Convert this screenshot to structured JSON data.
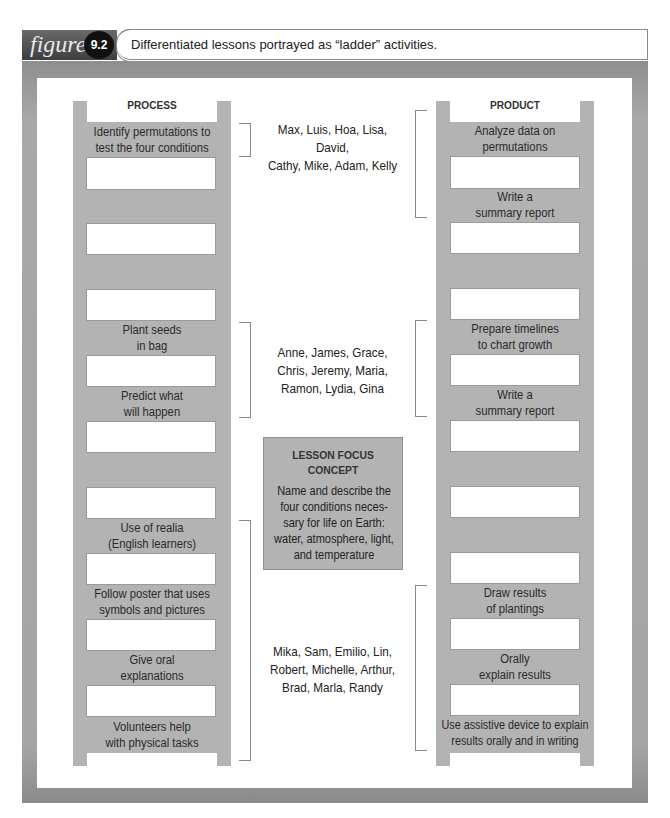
{
  "header": {
    "figure_word": "figure",
    "figure_number": "9.2",
    "caption": "Differentiated lessons portrayed as “ladder” activities."
  },
  "process_ladder": {
    "title": "PROCESS",
    "steps": [
      {
        "text": "Identify permutations to\ntest the four conditions"
      },
      {
        "text": ""
      },
      {
        "text": ""
      },
      {
        "text": "Plant seeds\nin bag"
      },
      {
        "text": "Predict what\nwill happen"
      },
      {
        "text": ""
      },
      {
        "text": "Use of realia\n(English learners)"
      },
      {
        "text": "Follow poster that uses\nsymbols and pictures"
      },
      {
        "text": "Give oral\nexplanations"
      },
      {
        "text": "Volunteers help\nwith physical tasks"
      }
    ]
  },
  "product_ladder": {
    "title": "PRODUCT",
    "steps": [
      {
        "text": "Analyze data on\npermutations"
      },
      {
        "text": "Write a\nsummary report"
      },
      {
        "text": ""
      },
      {
        "text": "Prepare timelines\nto chart growth"
      },
      {
        "text": "Write a\nsummary report"
      },
      {
        "text": ""
      },
      {
        "text": ""
      },
      {
        "text": "Draw results\nof plantings"
      },
      {
        "text": "Orally\nexplain results"
      },
      {
        "text": "Use assistive device to explain\nresults orally and in writing"
      }
    ]
  },
  "student_groups": [
    {
      "names": "Max, Luis, Hoa, Lisa, David,\nCathy, Mike, Adam, Kelly"
    },
    {
      "names": "Anne, James, Grace,\nChris, Jeremy, Maria,\nRamon, Lydia, Gina"
    },
    {
      "names": "Mika, Sam, Emilio, Lin,\nRobert, Michelle, Arthur,\nBrad, Marla, Randy"
    }
  ],
  "focus": {
    "title": "LESSON FOCUS\nCONCEPT",
    "body": "Name and describe the\nfour conditions neces-\nsary for life on Earth:\nwater, atmosphere, light,\nand temperature"
  },
  "colors": {
    "ladder_gray": "#b3b3b3",
    "frame_gray": "#a5a5a5",
    "header_dark": "#3e3e3e"
  }
}
